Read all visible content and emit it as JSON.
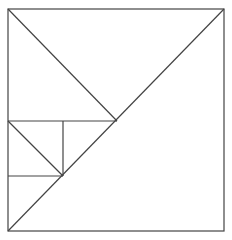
{
  "diagram": {
    "type": "geometric-figure",
    "stroke_color": "#444444",
    "background": "#ffffff",
    "outer_square": {
      "x1": 8,
      "y1": 9,
      "x2": 224,
      "y2": 231
    },
    "lines": [
      {
        "id": "main-diagonal",
        "x1": 8,
        "y1": 231,
        "x2": 224,
        "y2": 9
      },
      {
        "id": "upper-left-diagonal",
        "x1": 8,
        "y1": 9,
        "x2": 117,
        "y2": 121
      },
      {
        "id": "mid-horizontal",
        "x1": 8,
        "y1": 121,
        "x2": 117,
        "y2": 121
      },
      {
        "id": "small-square-right",
        "x1": 63,
        "y1": 121,
        "x2": 63,
        "y2": 176
      },
      {
        "id": "small-square-bottom",
        "x1": 8,
        "y1": 176,
        "x2": 63,
        "y2": 176
      },
      {
        "id": "small-square-diagonal",
        "x1": 8,
        "y1": 121,
        "x2": 63,
        "y2": 176
      }
    ]
  }
}
